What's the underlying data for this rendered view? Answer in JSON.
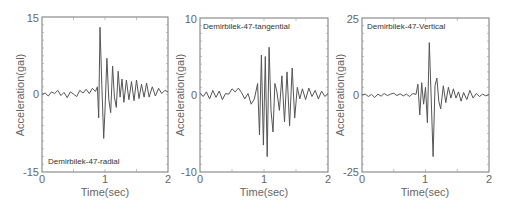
{
  "chart_data": [
    {
      "type": "line",
      "title": "Demirbilek-47-radial",
      "xlabel": "Time(sec)",
      "ylabel": "Acceleration(gal)",
      "xlim": [
        0,
        2
      ],
      "ylim": [
        -15,
        15
      ],
      "xticks": [
        "0",
        "1",
        "2"
      ],
      "yticks": [
        "-15",
        "0",
        "15"
      ],
      "label_position": "bottom-left",
      "series": [
        {
          "name": "radial",
          "x": [
            0,
            0.05,
            0.1,
            0.15,
            0.2,
            0.25,
            0.3,
            0.35,
            0.4,
            0.45,
            0.5,
            0.55,
            0.6,
            0.65,
            0.7,
            0.75,
            0.8,
            0.85,
            0.88,
            0.9,
            0.92,
            0.95,
            0.98,
            1.0,
            1.03,
            1.06,
            1.09,
            1.12,
            1.15,
            1.18,
            1.21,
            1.24,
            1.27,
            1.3,
            1.34,
            1.38,
            1.42,
            1.46,
            1.5,
            1.54,
            1.58,
            1.62,
            1.66,
            1.7,
            1.75,
            1.8,
            1.85,
            1.9,
            1.95,
            2.0
          ],
          "y": [
            0,
            0.3,
            -0.3,
            0.5,
            0.2,
            0.8,
            -0.2,
            0.4,
            -0.6,
            0.5,
            0.1,
            -0.4,
            0.8,
            0.3,
            1.0,
            0.2,
            1.2,
            0.6,
            1.5,
            -4.5,
            13,
            2.0,
            -8.5,
            -3.0,
            7.0,
            -1.0,
            -3.5,
            5.5,
            -0.5,
            -2.5,
            4.5,
            -0.5,
            3.0,
            -1.5,
            2.8,
            -1.0,
            2.5,
            -1.2,
            2.8,
            -0.8,
            2.0,
            -0.5,
            2.2,
            -0.5,
            1.5,
            -0.3,
            1.2,
            0.2,
            0.8,
            0.5
          ]
        }
      ]
    },
    {
      "type": "line",
      "title": "Demirbilek-47-tangential",
      "xlabel": "Time(sec)",
      "ylabel": "Acceleration(gal)",
      "xlim": [
        0,
        2
      ],
      "ylim": [
        -10,
        10
      ],
      "xticks": [
        "0",
        "1",
        "2"
      ],
      "yticks": [
        "-10",
        "0",
        "10"
      ],
      "label_position": "top-left",
      "series": [
        {
          "name": "tangential",
          "x": [
            0,
            0.05,
            0.1,
            0.15,
            0.2,
            0.25,
            0.3,
            0.35,
            0.4,
            0.45,
            0.5,
            0.55,
            0.6,
            0.65,
            0.7,
            0.75,
            0.8,
            0.85,
            0.9,
            0.93,
            0.96,
            0.99,
            1.02,
            1.05,
            1.08,
            1.11,
            1.14,
            1.17,
            1.2,
            1.24,
            1.28,
            1.32,
            1.36,
            1.4,
            1.44,
            1.48,
            1.52,
            1.56,
            1.6,
            1.65,
            1.7,
            1.75,
            1.8,
            1.85,
            1.9,
            1.95,
            2.0
          ],
          "y": [
            0.3,
            -0.2,
            0.4,
            -0.5,
            0.6,
            -0.3,
            0.5,
            -0.6,
            0.2,
            0.1,
            0.8,
            0.4,
            0.9,
            0.3,
            -0.5,
            0.2,
            -1.2,
            -0.5,
            1.5,
            -5.2,
            5.2,
            -6.5,
            5.0,
            -8.0,
            6.2,
            -2.0,
            -4.8,
            1.5,
            0.5,
            -2.0,
            2.5,
            -3.5,
            3.0,
            -4.0,
            3.5,
            -3.0,
            1.0,
            -0.5,
            0.8,
            -0.6,
            0.9,
            -0.2,
            0.6,
            -0.5,
            0.5,
            -0.2,
            0.2
          ]
        }
      ]
    },
    {
      "type": "line",
      "title": "Demirbilek-47-Vertical",
      "xlabel": "Time(sec)",
      "ylabel": "Acceleration(gal)",
      "xlim": [
        0,
        2
      ],
      "ylim": [
        -25,
        25
      ],
      "xticks": [
        "0",
        "1",
        "2"
      ],
      "yticks": [
        "-25",
        "0",
        "25"
      ],
      "label_position": "top-left",
      "series": [
        {
          "name": "vertical",
          "x": [
            0,
            0.05,
            0.1,
            0.15,
            0.2,
            0.25,
            0.3,
            0.35,
            0.4,
            0.45,
            0.5,
            0.55,
            0.6,
            0.65,
            0.7,
            0.75,
            0.8,
            0.85,
            0.88,
            0.91,
            0.94,
            0.97,
            1.0,
            1.03,
            1.06,
            1.09,
            1.12,
            1.15,
            1.18,
            1.21,
            1.24,
            1.28,
            1.32,
            1.36,
            1.4,
            1.44,
            1.48,
            1.52,
            1.56,
            1.6,
            1.65,
            1.7,
            1.75,
            1.8,
            1.85,
            1.9,
            1.95,
            2.0
          ],
          "y": [
            0,
            0.3,
            -0.5,
            0.2,
            -0.8,
            0.3,
            -0.4,
            0.5,
            -0.2,
            0.3,
            0.6,
            -0.2,
            0.4,
            -0.3,
            0.3,
            -0.5,
            0.5,
            0.2,
            3.5,
            -6.5,
            4.0,
            -3.0,
            2.5,
            -9.0,
            17,
            -1.0,
            -20,
            3.0,
            5.5,
            -2.0,
            -4.5,
            3.0,
            -2.5,
            2.5,
            -1.0,
            2.0,
            -1.0,
            1.0,
            -2.0,
            0.8,
            -1.5,
            1.5,
            -1.0,
            0.5,
            -0.5,
            0.3,
            -0.3,
            0.2
          ]
        }
      ]
    }
  ],
  "panels": [
    {
      "label": "Demirbilek-47-radial",
      "ymax": "15",
      "ymid": "0",
      "ymin": "-15",
      "x0": "0",
      "x1": "1",
      "x2": "2",
      "xlabel": "Time(sec)",
      "ylabel": "Acceleration(gal)"
    },
    {
      "label": "Demirbilek-47-tangential",
      "ymax": "10",
      "ymid": "0",
      "ymin": "-10",
      "x0": "0",
      "x1": "1",
      "x2": "2",
      "xlabel": "Time(sec)",
      "ylabel": "Acceleration(gal)"
    },
    {
      "label": "Demirbilek-47-Vertical",
      "ymax": "25",
      "ymid": "0",
      "ymin": "-25",
      "x0": "0",
      "x1": "1",
      "x2": "2",
      "xlabel": "Time(sec)",
      "ylabel": "Acceleration(gal)"
    }
  ]
}
